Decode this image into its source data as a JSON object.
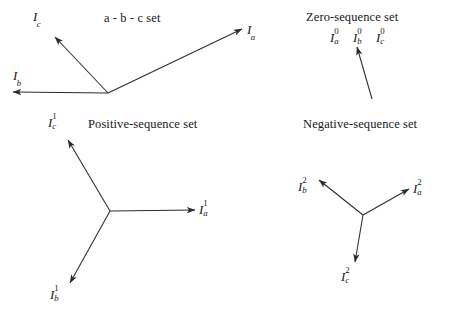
{
  "figure": {
    "kind": "phasor-diagram",
    "stroke_color": "#2b2b2b",
    "text_color": "#171717",
    "background": "#ffffff"
  },
  "panels": [
    {
      "id": "abc",
      "title": "a - b - c set",
      "title_pos": {
        "x": 104,
        "y": 12
      },
      "origin": {
        "x": 108,
        "y": 93
      },
      "phasors": [
        {
          "name": "Ia",
          "base": "I",
          "sub": "a",
          "sup": "",
          "tip": {
            "x": 242,
            "y": 29
          },
          "label_pos": {
            "x": 247,
            "y": 23
          }
        },
        {
          "name": "Ic",
          "base": "I",
          "sub": "c",
          "sup": "",
          "tip": {
            "x": 55,
            "y": 37
          },
          "label_pos": {
            "x": 33,
            "y": 10
          }
        },
        {
          "name": "Ib",
          "base": "I",
          "sub": "b",
          "sup": "",
          "tip": {
            "x": 13,
            "y": 92
          },
          "label_pos": {
            "x": 13,
            "y": 69
          }
        }
      ]
    },
    {
      "id": "zero",
      "title": "Zero-sequence set",
      "title_pos": {
        "x": 306,
        "y": 11
      },
      "origin": {
        "x": 372,
        "y": 99
      },
      "component_labels": [
        {
          "base": "I",
          "sub": "a",
          "sup": "0",
          "pos": {
            "x": 330,
            "y": 29
          }
        },
        {
          "base": "I",
          "sub": "b",
          "sup": "0",
          "pos": {
            "x": 353,
            "y": 29
          }
        },
        {
          "base": "I",
          "sub": "c",
          "sup": "0",
          "pos": {
            "x": 376,
            "y": 29
          }
        }
      ],
      "phasors": [
        {
          "name": "I0",
          "base": "I",
          "sub": "",
          "sup": "0",
          "tip": {
            "x": 357,
            "y": 47
          },
          "label_pos": null
        }
      ]
    },
    {
      "id": "positive",
      "title": "Positive-sequence set",
      "title_pos": {
        "x": 88,
        "y": 118
      },
      "origin": {
        "x": 110,
        "y": 211
      },
      "phasors": [
        {
          "name": "Ia1",
          "base": "I",
          "sub": "a",
          "sup": "1",
          "tip": {
            "x": 195,
            "y": 210
          },
          "label_pos": {
            "x": 199,
            "y": 201
          }
        },
        {
          "name": "Ic1",
          "base": "I",
          "sub": "c",
          "sup": "1",
          "tip": {
            "x": 68,
            "y": 140
          },
          "label_pos": {
            "x": 48,
            "y": 114
          }
        },
        {
          "name": "Ib1",
          "base": "I",
          "sub": "b",
          "sup": "1",
          "tip": {
            "x": 70,
            "y": 283
          },
          "label_pos": {
            "x": 50,
            "y": 286
          }
        }
      ]
    },
    {
      "id": "negative",
      "title": "Negative-sequence set",
      "title_pos": {
        "x": 303,
        "y": 118
      },
      "origin": {
        "x": 363,
        "y": 215
      },
      "phasors": [
        {
          "name": "Ia2",
          "base": "I",
          "sub": "a",
          "sup": "2",
          "tip": {
            "x": 409,
            "y": 189
          },
          "label_pos": {
            "x": 413,
            "y": 180
          }
        },
        {
          "name": "Ib2",
          "base": "I",
          "sub": "b",
          "sup": "2",
          "tip": {
            "x": 319,
            "y": 180
          },
          "label_pos": {
            "x": 298,
            "y": 178
          }
        },
        {
          "name": "Ic2",
          "base": "I",
          "sub": "c",
          "sup": "2",
          "tip": {
            "x": 355,
            "y": 262
          },
          "label_pos": {
            "x": 341,
            "y": 268
          }
        }
      ]
    }
  ]
}
